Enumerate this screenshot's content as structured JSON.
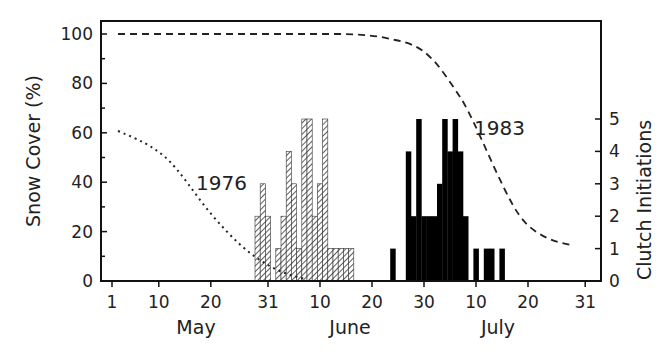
{
  "chart_data": {
    "type": "bar",
    "title": "",
    "xlabel": "",
    "ylabel": "Snow Cover (%)",
    "y2label": "Clutch Initiations",
    "ylim": [
      0,
      100
    ],
    "y2lim": [
      0,
      5
    ],
    "yticks": [
      "0",
      "20",
      "40",
      "60",
      "80",
      "100"
    ],
    "y2ticks": [
      "0",
      "1",
      "2",
      "3",
      "4",
      "5"
    ],
    "xticks": [
      "1",
      "10",
      "20",
      "31",
      "10",
      "20",
      "30",
      "10",
      "20",
      "31"
    ],
    "months": [
      "May",
      "June",
      "July"
    ],
    "grid": false,
    "annotations": [
      "1976",
      "1983"
    ],
    "series": [
      {
        "name": "1976 clutch initiations",
        "kind": "bar",
        "style": "hatched",
        "start_date": "May 29",
        "values": [
          2,
          3,
          2,
          0,
          1,
          2,
          4,
          3,
          1,
          5,
          5,
          2,
          3,
          5,
          1,
          1,
          1,
          1,
          1
        ]
      },
      {
        "name": "1983 clutch initiations",
        "kind": "bar",
        "style": "solid",
        "start_date": "June 24",
        "values": [
          1,
          0,
          0,
          4,
          2,
          5,
          2,
          2,
          2,
          3,
          5,
          4,
          5,
          4,
          2,
          0,
          1,
          0,
          1,
          1,
          0,
          1
        ]
      },
      {
        "name": "1976 snow cover",
        "kind": "line",
        "style": "dotted",
        "points": [
          [
            "May 2",
            60
          ],
          [
            "May 10",
            53
          ],
          [
            "May 15",
            44
          ],
          [
            "May 20",
            30
          ],
          [
            "May 25",
            16
          ],
          [
            "May 31",
            5
          ],
          [
            "June 5",
            0
          ]
        ]
      },
      {
        "name": "1983 snow cover",
        "kind": "line",
        "style": "dashed",
        "points": [
          [
            "May 2",
            100
          ],
          [
            "June 15",
            100
          ],
          [
            "June 25",
            96
          ],
          [
            "July 1",
            88
          ],
          [
            "July 5",
            68
          ],
          [
            "July 10",
            35
          ],
          [
            "July 15",
            15
          ],
          [
            "July 20",
            10
          ],
          [
            "July 30",
            5
          ]
        ]
      }
    ]
  }
}
